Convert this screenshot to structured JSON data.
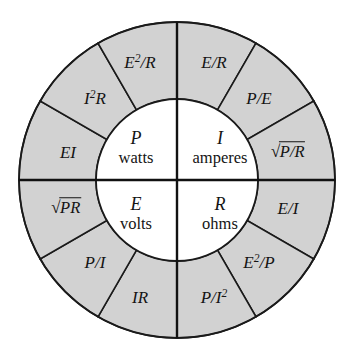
{
  "diagram": {
    "name": "ohms-law-wheel",
    "background_color": "#ffffff",
    "ring_fill_color": "#d2d2d2",
    "hub_fill_color": "#ffffff",
    "line_color": "#1a1a1a",
    "center": {
      "x": 177,
      "y": 180
    },
    "outer_radius": 158,
    "inner_radius": 81,
    "segment_span_degrees": 30,
    "segment_count": 12,
    "quadrant_count": 4
  },
  "hub": {
    "quadrants": [
      {
        "id": "power",
        "symbol": "P",
        "unit": "watts",
        "cx": 136,
        "cy": 148
      },
      {
        "id": "current",
        "symbol": "I",
        "unit": "amperes",
        "cx": 220,
        "cy": 148
      },
      {
        "id": "voltage",
        "symbol": "E",
        "unit": "volts",
        "cx": 136,
        "cy": 214
      },
      {
        "id": "resistance",
        "symbol": "R",
        "unit": "ohms",
        "cx": 220,
        "cy": 214
      }
    ]
  },
  "ring": {
    "segments": [
      {
        "id": "seg-e2-over-r",
        "quadrant": "power",
        "text": "E2/R",
        "html": "<i>E</i><sup>2</sup>/<i>R</i>",
        "cx": 140,
        "cy": 62,
        "angle_deg": 255
      },
      {
        "id": "seg-i2-r",
        "quadrant": "power",
        "text": "I2R",
        "html": "<i>I</i><sup>2</sup><i>R</i>",
        "cx": 95,
        "cy": 98,
        "angle_deg": 225
      },
      {
        "id": "seg-ei",
        "quadrant": "power",
        "text": "EI",
        "html": "<i>EI</i>",
        "cx": 68,
        "cy": 152,
        "angle_deg": 195
      },
      {
        "id": "seg-e-over-r",
        "quadrant": "current",
        "text": "E/R",
        "html": "<i>E</i>/<i>R</i>",
        "cx": 214,
        "cy": 62,
        "angle_deg": 285
      },
      {
        "id": "seg-p-over-e",
        "quadrant": "current",
        "text": "P/E",
        "html": "<i>P</i>/<i>E</i>",
        "cx": 259,
        "cy": 98,
        "angle_deg": 315
      },
      {
        "id": "seg-sqrt-p-over-r",
        "quadrant": "current",
        "text": "sqrt(P/R)",
        "html": "<span class=\"rad\"><span class=\"sign\">√</span><span class=\"bar\"><i>P</i>/<i>R</i></span></span>",
        "cx": 288,
        "cy": 152,
        "angle_deg": 345
      },
      {
        "id": "seg-e-over-i",
        "quadrant": "resistance",
        "text": "E/I",
        "html": "<i>E</i>/<i>I</i>",
        "cx": 288,
        "cy": 208,
        "angle_deg": 15
      },
      {
        "id": "seg-e2-over-p",
        "quadrant": "resistance",
        "text": "E2/P",
        "html": "<i>E</i><sup>2</sup>/<i>P</i>",
        "cx": 259,
        "cy": 262,
        "angle_deg": 45
      },
      {
        "id": "seg-p-over-i2",
        "quadrant": "resistance",
        "text": "P/I2",
        "html": "<i>P</i>/<i>I</i><sup>2</sup>",
        "cx": 214,
        "cy": 297,
        "angle_deg": 75
      },
      {
        "id": "seg-ir",
        "quadrant": "voltage",
        "text": "IR",
        "html": "<i>IR</i>",
        "cx": 140,
        "cy": 297,
        "angle_deg": 105
      },
      {
        "id": "seg-p-over-i",
        "quadrant": "voltage",
        "text": "P/I",
        "html": "<i>P</i>/<i>I</i>",
        "cx": 95,
        "cy": 262,
        "angle_deg": 135
      },
      {
        "id": "seg-sqrt-pr",
        "quadrant": "voltage",
        "text": "sqrt(PR)",
        "html": "<span class=\"rad\"><span class=\"sign\">√</span><span class=\"bar\"><i>PR</i></span></span>",
        "cx": 66,
        "cy": 208,
        "angle_deg": 165
      }
    ]
  }
}
